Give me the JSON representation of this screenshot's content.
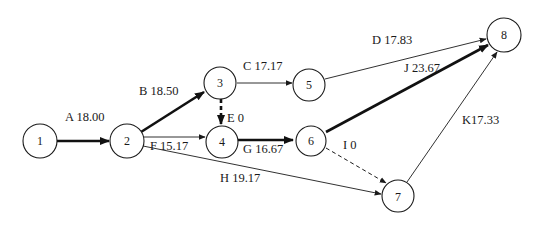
{
  "diagram": {
    "title": "",
    "type": "activity-on-arrow network",
    "nodes": [
      {
        "id": "1",
        "label": "1"
      },
      {
        "id": "2",
        "label": "2"
      },
      {
        "id": "3",
        "label": "3"
      },
      {
        "id": "4",
        "label": "4"
      },
      {
        "id": "5",
        "label": "5"
      },
      {
        "id": "6",
        "label": "6"
      },
      {
        "id": "7",
        "label": "7"
      },
      {
        "id": "8",
        "label": "8"
      }
    ],
    "edges": [
      {
        "activity": "A",
        "duration": "18.00",
        "label": "A 18.00",
        "from": "1",
        "to": "2",
        "style": "critical"
      },
      {
        "activity": "B",
        "duration": "18.50",
        "label": "B 18.50",
        "from": "2",
        "to": "3",
        "style": "critical"
      },
      {
        "activity": "C",
        "duration": "17.17",
        "label": "C 17.17",
        "from": "3",
        "to": "5",
        "style": "normal"
      },
      {
        "activity": "D",
        "duration": "17.83",
        "label": "D 17.83",
        "from": "5",
        "to": "8",
        "style": "normal"
      },
      {
        "activity": "E",
        "duration": "0",
        "label": "E  0",
        "from": "3",
        "to": "4",
        "style": "critical-dummy"
      },
      {
        "activity": "F",
        "duration": "15.17",
        "label": "F 15.17",
        "from": "2",
        "to": "4",
        "style": "normal"
      },
      {
        "activity": "G",
        "duration": "16.67",
        "label": "G 16.67",
        "from": "4",
        "to": "6",
        "style": "critical"
      },
      {
        "activity": "H",
        "duration": "19.17",
        "label": "H 19.17",
        "from": "2",
        "to": "7",
        "style": "normal"
      },
      {
        "activity": "I",
        "duration": "0",
        "label": "I 0",
        "from": "6",
        "to": "7",
        "style": "dummy"
      },
      {
        "activity": "J",
        "duration": "23.67",
        "label": "J 23.67",
        "from": "6",
        "to": "8",
        "style": "critical"
      },
      {
        "activity": "K",
        "duration": "17.33",
        "label": "K17.33",
        "from": "7",
        "to": "8",
        "style": "normal"
      }
    ]
  }
}
